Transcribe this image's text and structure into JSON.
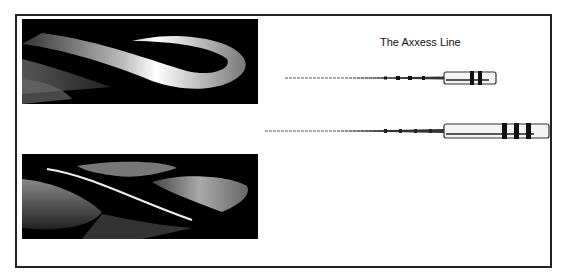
{
  "figure": {
    "caption": "The Axxess Line",
    "panels": [
      {
        "name": "file-tip-closeup-top",
        "description": "close-up of fluted file tip, spiral flutes"
      },
      {
        "name": "file-tip-closeup-bottom",
        "description": "close-up of fluted file tip, side view"
      }
    ],
    "instruments": [
      {
        "name": "axxess-file-1"
      },
      {
        "name": "axxess-file-2"
      }
    ]
  },
  "colors": {
    "frame": "#222222",
    "photo_background": "#000000",
    "text": "#111111"
  }
}
